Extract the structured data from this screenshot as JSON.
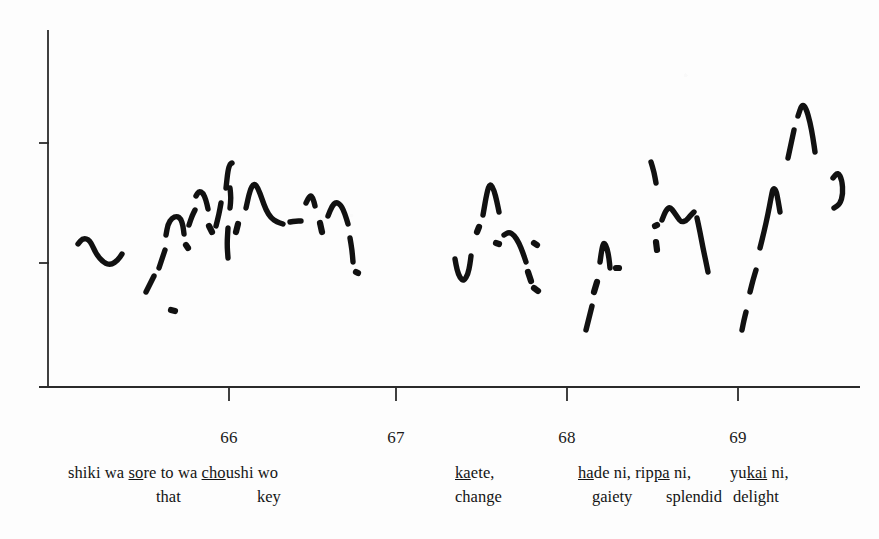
{
  "figure": {
    "kind": "f0-pitch-contour",
    "ink_color": "#111111",
    "axis_color": "#2b2b2b",
    "background_color": "#fdfdfd"
  },
  "axes": {
    "y_axis": {
      "label": "",
      "ticks": [
        {
          "name": "upper-tick",
          "label": "",
          "y_px": 143
        },
        {
          "name": "lower-tick",
          "label": "",
          "y_px": 263
        }
      ],
      "top_px": 30,
      "bottom_px": 387
    },
    "x_axis": {
      "label": "",
      "origin_px": 48,
      "right_px": 860,
      "baseline_px": 387,
      "ticks": [
        {
          "label": "66",
          "x_px": 229
        },
        {
          "label": "67",
          "x_px": 396
        },
        {
          "label": "68",
          "x_px": 567
        },
        {
          "label": "69",
          "x_px": 738
        }
      ]
    }
  },
  "transcription": {
    "romaji_groups": [
      {
        "name": "group-1",
        "x_px": 68,
        "parts": [
          {
            "text": "shiki wa ",
            "underline": false
          },
          {
            "text": "s",
            "underline": true
          },
          {
            "text": "o",
            "underline": true
          },
          {
            "text": "re",
            "underline": false
          },
          {
            "text": " to wa ",
            "underline": false
          },
          {
            "text": "cho",
            "underline": true
          },
          {
            "text": "ushi wo",
            "underline": false
          }
        ],
        "plain": "shiki wa sore to wa choushi wo"
      },
      {
        "name": "group-2",
        "x_px": 455,
        "parts": [
          {
            "text": "ka",
            "underline": true
          },
          {
            "text": "ete,",
            "underline": false
          }
        ],
        "plain": "kaete,"
      },
      {
        "name": "group-3",
        "x_px": 578,
        "parts": [
          {
            "text": "ha",
            "underline": true
          },
          {
            "text": "de ni, rip",
            "underline": false
          },
          {
            "text": "pa",
            "underline": true
          },
          {
            "text": " ni,",
            "underline": false
          }
        ],
        "plain": "hade ni, rippa ni,"
      },
      {
        "name": "group-4",
        "x_px": 730,
        "parts": [
          {
            "text": "yu",
            "underline": false
          },
          {
            "text": "kai",
            "underline": true
          },
          {
            "text": " ni,",
            "underline": false
          }
        ],
        "plain": "yukai ni,"
      }
    ],
    "glosses": [
      {
        "name": "gloss-that",
        "text": "that",
        "x_px": 156
      },
      {
        "name": "gloss-key",
        "text": "key",
        "x_px": 257
      },
      {
        "name": "gloss-change",
        "text": "change",
        "x_px": 455
      },
      {
        "name": "gloss-gloss-gaiety",
        "text": "gaiety",
        "x_px": 592
      },
      {
        "name": "gloss-splendid",
        "text": "splendid",
        "x_px": 666
      },
      {
        "name": "gloss-delight",
        "text": "delight",
        "x_px": 733
      }
    ],
    "romaji_baseline_y_px": 463,
    "gloss_baseline_y_px": 487,
    "tick_label_y_px": 428
  },
  "chart_data": {
    "type": "line",
    "title": "",
    "xlabel": "",
    "ylabel": "",
    "grid": false,
    "legend": null,
    "note": "Broken (voiceless-gapped) fundamental-frequency trace; x in seconds, y in arbitrary F0 units. Each segment is one voiced stretch.",
    "xlim": [
      65.33,
      69.92
    ],
    "ylim": [
      0,
      100
    ],
    "x_tick_values": [
      66,
      67,
      68,
      69
    ],
    "y_tick_values": [
      66,
      40
    ],
    "segments": [
      {
        "name": "segment-1",
        "points": [
          [
            78,
            244
          ],
          [
            83,
            238
          ],
          [
            90,
            240
          ],
          [
            96,
            254
          ],
          [
            104,
            263
          ],
          [
            111,
            265
          ],
          [
            118,
            260
          ],
          [
            122,
            254
          ]
        ]
      },
      {
        "name": "segment-2",
        "points": [
          [
            146,
            292
          ],
          [
            150,
            284
          ],
          [
            154,
            276
          ]
        ]
      },
      {
        "name": "segment-3",
        "points": [
          [
            159,
            268
          ],
          [
            162,
            259
          ],
          [
            165,
            250
          ]
        ]
      },
      {
        "name": "segment-4",
        "points": [
          [
            166,
            235
          ],
          [
            168,
            224
          ],
          [
            172,
            218
          ],
          [
            177,
            216
          ],
          [
            181,
            219
          ],
          [
            183,
            226
          ],
          [
            184,
            234
          ]
        ]
      },
      {
        "name": "segment-5-dot",
        "points": [
          [
            171,
            310
          ],
          [
            175,
            311
          ]
        ]
      },
      {
        "name": "segment-6",
        "points": [
          [
            186,
            245
          ],
          [
            188,
            248
          ]
        ]
      },
      {
        "name": "segment-7",
        "points": [
          [
            189,
            225
          ],
          [
            192,
            216
          ],
          [
            195,
            210
          ]
        ]
      },
      {
        "name": "segment-8",
        "points": [
          [
            196,
            196
          ],
          [
            199,
            191
          ],
          [
            203,
            193
          ],
          [
            206,
            200
          ],
          [
            208,
            209
          ]
        ]
      },
      {
        "name": "segment-9",
        "points": [
          [
            209,
            226
          ],
          [
            212,
            232
          ]
        ]
      },
      {
        "name": "segment-10",
        "points": [
          [
            216,
            226
          ],
          [
            219,
            214
          ],
          [
            221,
            203
          ]
        ]
      },
      {
        "name": "segment-11",
        "points": [
          [
            226,
            188
          ],
          [
            228,
            170
          ],
          [
            230,
            164
          ],
          [
            232,
            163
          ]
        ]
      },
      {
        "name": "segment-12",
        "points": [
          [
            230,
            188
          ],
          [
            231,
            198
          ],
          [
            230,
            208
          ]
        ]
      },
      {
        "name": "segment-13",
        "points": [
          [
            228,
            228
          ],
          [
            227,
            244
          ],
          [
            228,
            258
          ]
        ]
      },
      {
        "name": "segment-14",
        "points": [
          [
            236,
            232
          ],
          [
            238,
            224
          ]
        ]
      },
      {
        "name": "segment-15",
        "points": [
          [
            246,
            208
          ],
          [
            250,
            190
          ],
          [
            254,
            183
          ],
          [
            258,
            188
          ],
          [
            262,
            199
          ],
          [
            266,
            210
          ],
          [
            271,
            218
          ],
          [
            277,
            222
          ],
          [
            283,
            224
          ]
        ]
      },
      {
        "name": "segment-16",
        "points": [
          [
            290,
            222
          ],
          [
            296,
            221
          ],
          [
            301,
            221
          ]
        ]
      },
      {
        "name": "segment-17",
        "points": [
          [
            306,
            203
          ],
          [
            310,
            195
          ],
          [
            313,
            198
          ],
          [
            315,
            206
          ]
        ]
      },
      {
        "name": "segment-18",
        "points": [
          [
            320,
            223
          ],
          [
            322,
            232
          ]
        ]
      },
      {
        "name": "segment-19",
        "points": [
          [
            328,
            216
          ],
          [
            332,
            206
          ],
          [
            336,
            202
          ],
          [
            341,
            205
          ],
          [
            345,
            214
          ],
          [
            348,
            224
          ]
        ]
      },
      {
        "name": "segment-20",
        "points": [
          [
            350,
            238
          ],
          [
            352,
            250
          ],
          [
            353,
            262
          ]
        ]
      },
      {
        "name": "segment-21-dot",
        "points": [
          [
            356,
            272
          ],
          [
            358,
            273
          ]
        ]
      },
      {
        "name": "segment-22",
        "points": [
          [
            455,
            259
          ],
          [
            457,
            270
          ],
          [
            460,
            278
          ],
          [
            464,
            281
          ],
          [
            468,
            274
          ],
          [
            470,
            264
          ],
          [
            471,
            256
          ]
        ]
      },
      {
        "name": "segment-23",
        "points": [
          [
            477,
            232
          ],
          [
            479,
            227
          ]
        ]
      },
      {
        "name": "segment-24",
        "points": [
          [
            483,
            215
          ],
          [
            487,
            192
          ],
          [
            490,
            183
          ],
          [
            494,
            190
          ],
          [
            497,
            202
          ],
          [
            499,
            212
          ]
        ]
      },
      {
        "name": "segment-25",
        "points": [
          [
            496,
            243
          ],
          [
            499,
            244
          ]
        ]
      },
      {
        "name": "segment-26",
        "points": [
          [
            504,
            235
          ],
          [
            509,
            232
          ],
          [
            514,
            235
          ],
          [
            519,
            243
          ],
          [
            523,
            253
          ],
          [
            526,
            262
          ]
        ]
      },
      {
        "name": "segment-27",
        "points": [
          [
            534,
            243
          ],
          [
            537,
            245
          ]
        ]
      },
      {
        "name": "segment-28",
        "points": [
          [
            528,
            272
          ],
          [
            531,
            281
          ]
        ]
      },
      {
        "name": "segment-29",
        "points": [
          [
            534,
            288
          ],
          [
            538,
            291
          ]
        ]
      },
      {
        "name": "segment-30",
        "points": [
          [
            586,
            330
          ],
          [
            589,
            318
          ],
          [
            592,
            306
          ]
        ]
      },
      {
        "name": "segment-31",
        "points": [
          [
            594,
            292
          ],
          [
            597,
            282
          ]
        ]
      },
      {
        "name": "segment-32",
        "points": [
          [
            600,
            262
          ],
          [
            602,
            248
          ],
          [
            604,
            242
          ],
          [
            607,
            248
          ],
          [
            609,
            258
          ],
          [
            610,
            268
          ]
        ]
      },
      {
        "name": "segment-33-dot",
        "points": [
          [
            616,
            268
          ],
          [
            619,
            268
          ]
        ]
      },
      {
        "name": "segment-34",
        "points": [
          [
            655,
            226
          ],
          [
            657,
            225
          ]
        ]
      },
      {
        "name": "segment-35",
        "points": [
          [
            656,
            242
          ],
          [
            657,
            250
          ]
        ]
      },
      {
        "name": "segment-36",
        "points": [
          [
            662,
            220
          ],
          [
            666,
            210
          ],
          [
            670,
            207
          ],
          [
            674,
            212
          ],
          [
            678,
            218
          ],
          [
            681,
            222
          ],
          [
            686,
            221
          ],
          [
            690,
            216
          ],
          [
            694,
            212
          ]
        ]
      },
      {
        "name": "segment-37",
        "points": [
          [
            697,
            218
          ],
          [
            700,
            232
          ],
          [
            703,
            248
          ],
          [
            706,
            262
          ],
          [
            708,
            272
          ]
        ]
      },
      {
        "name": "segment-38",
        "points": [
          [
            651,
            162
          ],
          [
            654,
            172
          ],
          [
            656,
            183
          ]
        ]
      },
      {
        "name": "segment-39",
        "points": [
          [
            742,
            330
          ],
          [
            744,
            320
          ],
          [
            746,
            312
          ]
        ]
      },
      {
        "name": "segment-40",
        "points": [
          [
            750,
            292
          ],
          [
            753,
            280
          ],
          [
            756,
            270
          ]
        ]
      },
      {
        "name": "segment-41",
        "points": [
          [
            760,
            248
          ],
          [
            764,
            232
          ],
          [
            768,
            214
          ],
          [
            771,
            198
          ],
          [
            773,
            188
          ],
          [
            776,
            190
          ],
          [
            778,
            200
          ],
          [
            780,
            212
          ]
        ]
      },
      {
        "name": "segment-42",
        "points": [
          [
            788,
            158
          ],
          [
            791,
            144
          ],
          [
            794,
            130
          ]
        ]
      },
      {
        "name": "segment-43",
        "points": [
          [
            798,
            116
          ],
          [
            802,
            104
          ],
          [
            806,
            108
          ],
          [
            810,
            122
          ],
          [
            813,
            138
          ],
          [
            815,
            152
          ]
        ]
      },
      {
        "name": "segment-44",
        "points": [
          [
            833,
            178
          ],
          [
            838,
            172
          ],
          [
            842,
            180
          ],
          [
            843,
            194
          ],
          [
            840,
            204
          ],
          [
            834,
            208
          ]
        ]
      }
    ]
  }
}
